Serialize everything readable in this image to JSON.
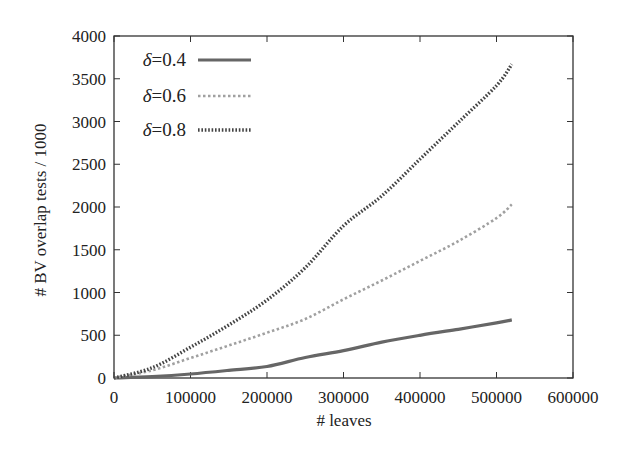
{
  "chart_data": {
    "type": "line",
    "title": "",
    "xlabel": "# leaves",
    "ylabel": "# BV overlap tests / 1000",
    "xlim": [
      0,
      600000
    ],
    "ylim": [
      0,
      4000
    ],
    "xticks": [
      0,
      100000,
      200000,
      300000,
      400000,
      500000,
      600000
    ],
    "xtick_labels": [
      "0",
      "100000",
      "200000",
      "300000",
      "400000",
      "500000",
      "600000"
    ],
    "yticks": [
      0,
      500,
      1000,
      1500,
      2000,
      2500,
      3000,
      3500,
      4000
    ],
    "ytick_labels": [
      "0",
      "500",
      "1000",
      "1500",
      "2000",
      "2500",
      "3000",
      "3500",
      "4000"
    ],
    "grid": false,
    "legend_position": "upper left",
    "x": [
      0,
      50000,
      100000,
      150000,
      200000,
      250000,
      300000,
      350000,
      400000,
      450000,
      500000,
      520000
    ],
    "series": [
      {
        "name": "δ=0.4",
        "delta_symbol": "δ",
        "value_text": "=0.4",
        "style": "solid",
        "color": "#666666",
        "values": [
          0,
          15,
          47,
          90,
          135,
          240,
          320,
          420,
          500,
          570,
          645,
          680
        ]
      },
      {
        "name": "δ=0.6",
        "delta_symbol": "δ",
        "value_text": "=0.6",
        "style": "dashed",
        "color": "#a0a0a0",
        "values": [
          0,
          90,
          234,
          380,
          530,
          690,
          920,
          1140,
          1370,
          1600,
          1870,
          2030
        ]
      },
      {
        "name": "δ=0.8",
        "delta_symbol": "δ",
        "value_text": "=0.8",
        "style": "dotted",
        "color": "#444444",
        "values": [
          0,
          120,
          360,
          620,
          912,
          1290,
          1780,
          2130,
          2560,
          2990,
          3420,
          3670
        ]
      }
    ]
  }
}
